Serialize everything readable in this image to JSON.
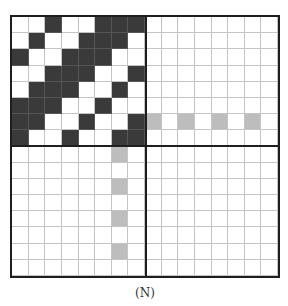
{
  "figure": {
    "caption": "(N)",
    "grid_size": 16,
    "quadrant_size": 8,
    "colors": {
      "black": "#3a3a3a",
      "gray": "#bdbdbd",
      "white": "#ffffff",
      "border": "#1e1e1e",
      "gridline": "#c4c4c4"
    },
    "top_left_pattern": [
      [
        0,
        0,
        1,
        0,
        0,
        1,
        1,
        1
      ],
      [
        0,
        1,
        0,
        0,
        1,
        1,
        1,
        0
      ],
      [
        1,
        0,
        0,
        1,
        1,
        1,
        0,
        0
      ],
      [
        0,
        0,
        1,
        1,
        1,
        0,
        0,
        1
      ],
      [
        0,
        1,
        1,
        1,
        0,
        0,
        1,
        0
      ],
      [
        1,
        1,
        1,
        0,
        0,
        1,
        0,
        0
      ],
      [
        1,
        1,
        0,
        0,
        1,
        0,
        0,
        1
      ],
      [
        1,
        0,
        0,
        1,
        0,
        0,
        1,
        1
      ]
    ],
    "gray_cells": [
      {
        "row": 6,
        "col": 8
      },
      {
        "row": 6,
        "col": 10
      },
      {
        "row": 6,
        "col": 12
      },
      {
        "row": 6,
        "col": 14
      },
      {
        "row": 8,
        "col": 6
      },
      {
        "row": 10,
        "col": 6
      },
      {
        "row": 12,
        "col": 6
      },
      {
        "row": 14,
        "col": 6
      }
    ]
  }
}
